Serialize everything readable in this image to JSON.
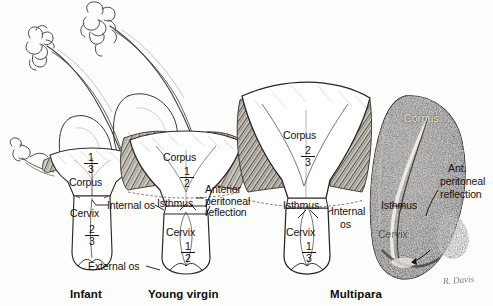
{
  "figure": {
    "background_color": "#fdfdfc",
    "ink_color": "#14110f"
  },
  "panels": [
    {
      "id": "infant",
      "caption": "Infant",
      "corpus_label": "Corpus",
      "corpus_fraction": {
        "numerator": "1",
        "denominator": "3"
      },
      "cervix_label": "Cervix",
      "cervix_fraction": {
        "numerator": "2",
        "denominator": "3"
      }
    },
    {
      "id": "young-virgin",
      "caption": "Young virgin",
      "corpus_label": "Corpus",
      "corpus_fraction": {
        "numerator": "1",
        "denominator": "2"
      },
      "isthmus_label": "Isthmus",
      "cervix_label": "Cervix",
      "cervix_fraction": {
        "numerator": "1",
        "denominator": "2"
      }
    },
    {
      "id": "multipara",
      "caption": "Multipara",
      "corpus_label": "Corpus",
      "corpus_fraction": {
        "numerator": "2",
        "denominator": "3"
      },
      "isthmus_label": "Isthmus",
      "cervix_label": "Cervix",
      "cervix_fraction": {
        "numerator": "1",
        "denominator": "3"
      }
    },
    {
      "id": "specimen",
      "caption": "",
      "corpus_label": "Corpus",
      "isthmus_label": "Isthmus",
      "cervix_label": "Cervix"
    }
  ],
  "callouts": {
    "internal_os_left": "Internal os",
    "external_os": "External os",
    "anterior_peritoneal_reflection": "Anterior peritoneal reflection",
    "internal_os_right_line1": "Internal",
    "internal_os_right_line2": "os",
    "ant_peritoneal_reflection_line1": "Ant.",
    "ant_peritoneal_reflection_line2": "peritoneal",
    "ant_peritoneal_reflection_line3": "reflection"
  },
  "signature": "R. Davis"
}
